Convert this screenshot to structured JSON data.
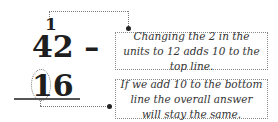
{
  "subtraction": {
    "carry_digit": "1",
    "top_line": "42 –",
    "bottom_line": "16",
    "highlighted_digit": "1"
  },
  "annotations": [
    {
      "text": "Changing the 2 in the units to 12 adds 10 to the top line."
    },
    {
      "text": "If we add 10 to the bottom line the overall answer will stay the same."
    }
  ]
}
